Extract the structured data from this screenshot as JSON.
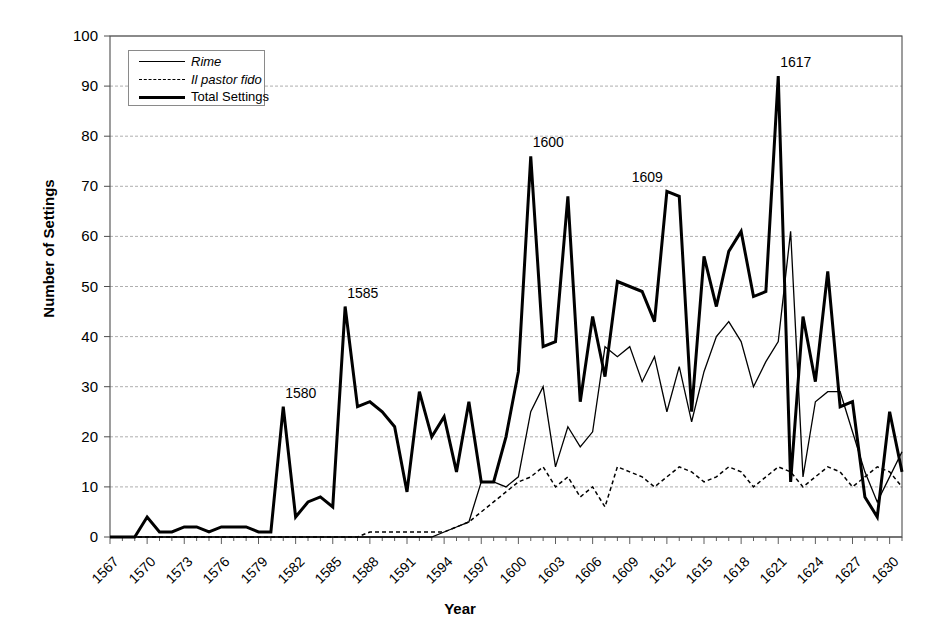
{
  "chart_data": {
    "type": "line",
    "title": "",
    "xlabel": "Year",
    "ylabel": "Number of Settings",
    "xlim": [
      1567,
      1631
    ],
    "ylim": [
      0,
      100
    ],
    "grid": true,
    "legend_position": "top-left",
    "x": [
      1567,
      1568,
      1569,
      1570,
      1571,
      1572,
      1573,
      1574,
      1575,
      1576,
      1577,
      1578,
      1579,
      1580,
      1581,
      1582,
      1583,
      1584,
      1585,
      1586,
      1587,
      1588,
      1589,
      1590,
      1591,
      1592,
      1593,
      1594,
      1595,
      1596,
      1597,
      1598,
      1599,
      1600,
      1601,
      1602,
      1603,
      1604,
      1605,
      1606,
      1607,
      1608,
      1609,
      1610,
      1611,
      1612,
      1613,
      1614,
      1615,
      1616,
      1617,
      1618,
      1619,
      1620,
      1621,
      1622,
      1623,
      1624,
      1625,
      1626,
      1627,
      1628,
      1629,
      1630,
      1631
    ],
    "xticks": [
      1567,
      1570,
      1573,
      1576,
      1579,
      1582,
      1585,
      1588,
      1591,
      1594,
      1597,
      1600,
      1603,
      1606,
      1609,
      1612,
      1615,
      1618,
      1621,
      1624,
      1627,
      1630
    ],
    "yticks": [
      0,
      10,
      20,
      30,
      40,
      50,
      60,
      70,
      80,
      90,
      100
    ],
    "series": [
      {
        "name": "Rime",
        "style": "thin-solid",
        "values": [
          0,
          0,
          0,
          0,
          0,
          0,
          0,
          0,
          0,
          0,
          0,
          0,
          0,
          0,
          0,
          0,
          0,
          0,
          0,
          0,
          0,
          0,
          0,
          0,
          0,
          0,
          0,
          1,
          2,
          3,
          11,
          11,
          10,
          12,
          25,
          30,
          14,
          22,
          18,
          21,
          38,
          36,
          38,
          31,
          36,
          25,
          34,
          23,
          33,
          40,
          43,
          39,
          30,
          35,
          39,
          61,
          12,
          27,
          29,
          29,
          21,
          13,
          7,
          12,
          17
        ]
      },
      {
        "name": "Il pastor fido",
        "style": "dashed",
        "values": [
          0,
          0,
          0,
          0,
          0,
          0,
          0,
          0,
          0,
          0,
          0,
          0,
          0,
          0,
          0,
          0,
          0,
          0,
          0,
          0,
          0,
          1,
          1,
          1,
          1,
          1,
          1,
          1,
          2,
          3,
          5,
          7,
          9,
          11,
          12,
          14,
          10,
          12,
          8,
          10,
          6,
          14,
          13,
          12,
          10,
          12,
          14,
          13,
          11,
          12,
          14,
          13,
          10,
          12,
          14,
          13,
          10,
          12,
          14,
          13,
          10,
          12,
          14,
          13,
          10
        ]
      },
      {
        "name": "Total Settings",
        "style": "thick-solid",
        "values": [
          0,
          0,
          0,
          4,
          1,
          1,
          2,
          2,
          1,
          2,
          2,
          2,
          1,
          1,
          26,
          4,
          7,
          8,
          6,
          46,
          26,
          27,
          25,
          22,
          9,
          29,
          20,
          24,
          13,
          27,
          11,
          11,
          20,
          33,
          76,
          38,
          39,
          68,
          27,
          44,
          32,
          51,
          50,
          49,
          43,
          69,
          68,
          25,
          56,
          46,
          57,
          61,
          48,
          49,
          92,
          11,
          44,
          31,
          53,
          26,
          27,
          8,
          4,
          25,
          13
        ]
      }
    ],
    "annotations": [
      {
        "label": "1580",
        "x": 1581,
        "y": 26
      },
      {
        "label": "1585",
        "x": 1586,
        "y": 46
      },
      {
        "label": "1600",
        "x": 1601,
        "y": 76
      },
      {
        "label": "1609",
        "x": 1609,
        "y": 69
      },
      {
        "label": "1617",
        "x": 1621,
        "y": 92
      }
    ]
  },
  "legend": {
    "items": [
      {
        "label": "Rime",
        "style": "thin-solid"
      },
      {
        "label": "Il pastor fido",
        "style": "dashed"
      },
      {
        "label": "Total Settings",
        "style": "thick-solid"
      }
    ]
  },
  "colors": {
    "line": "#000000",
    "grid": "#9a9a9a",
    "axis": "#4d4d4d",
    "background": "#ffffff"
  }
}
